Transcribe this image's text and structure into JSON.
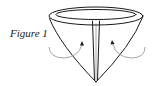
{
  "figure": {
    "label": "Figure 1",
    "colors": {
      "line": "#1a1a1a",
      "arrow": "#9a9a9a",
      "background": "#ffffff"
    },
    "arrows": [
      {
        "side": "left",
        "direction": "curving up toward center"
      },
      {
        "side": "right",
        "direction": "curving up toward center"
      }
    ]
  }
}
